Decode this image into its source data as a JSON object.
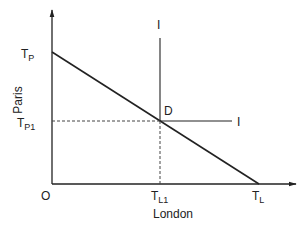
{
  "diagram": {
    "type": "economics-line-diagram",
    "colors": {
      "line": "#222222",
      "text": "#222222",
      "background": "#ffffff"
    },
    "axes": {
      "x_label": "London",
      "y_label": "Paris",
      "origin_label": "O"
    },
    "points": {
      "tp": {
        "main": "T",
        "sub": "P"
      },
      "tp1": {
        "main": "T",
        "sub": "P1"
      },
      "tl": {
        "main": "T",
        "sub": "L"
      },
      "tl1": {
        "main": "T",
        "sub": "L1"
      },
      "d": "D"
    },
    "indifference_labels": {
      "vertical": "I",
      "horizontal": "I"
    }
  }
}
